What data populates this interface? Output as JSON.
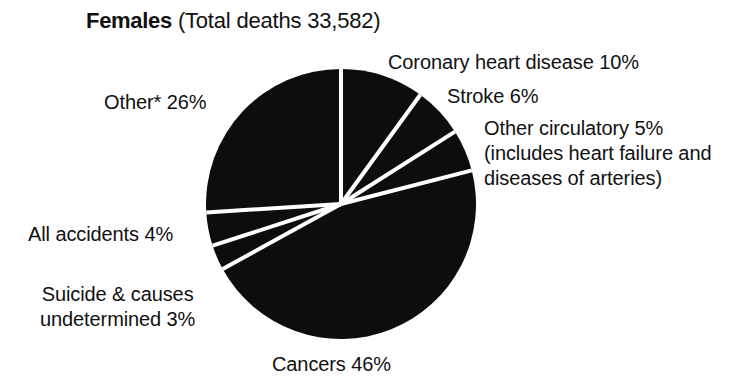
{
  "title": {
    "emphasis": "Females",
    "rest": " (Total deaths 33,582)",
    "full": "Females (Total deaths 33,582)"
  },
  "labels": {
    "coronary": "Coronary heart disease 10%",
    "stroke": "Stroke 6%",
    "other_circulatory_l1": "Other circulatory 5%",
    "other_circulatory_l2": "(includes heart failure and",
    "other_circulatory_l3": "diseases of arteries)",
    "other": "Other* 26%",
    "accidents": "All accidents 4%",
    "suicide_l1": "Suicide & causes",
    "suicide_l2": "undetermined 3%",
    "cancers": "Cancers 46%"
  },
  "colors": {
    "slice_fill": "#0d0d0d",
    "separator": "#ffffff",
    "text": "#111111",
    "background": "#ffffff"
  },
  "chart_data": {
    "type": "pie",
    "title": "Females (Total deaths 33,582)",
    "total_deaths": 33582,
    "total_deaths_label": "33,582",
    "units": "percent of total deaths",
    "start_angle_deg": 0,
    "direction": "clockwise",
    "center": {
      "x": 341,
      "y": 204
    },
    "radius": 135,
    "legend": "none (direct callout labels)",
    "grid": false,
    "categories": [
      "Coronary heart disease",
      "Stroke",
      "Other circulatory",
      "Cancers",
      "Suicide & causes undetermined",
      "All accidents",
      "Other*"
    ],
    "values": [
      10,
      6,
      5,
      46,
      3,
      4,
      26
    ],
    "slices": [
      {
        "label": "Coronary heart disease",
        "value": 10,
        "value_label": "10%",
        "start_deg": 0.0,
        "end_deg": 36.0
      },
      {
        "label": "Stroke",
        "value": 6,
        "value_label": "6%",
        "start_deg": 36.0,
        "end_deg": 57.6
      },
      {
        "label": "Other circulatory",
        "value": 5,
        "value_label": "5%",
        "start_deg": 57.6,
        "end_deg": 75.6,
        "note": "includes heart failure and diseases of arteries"
      },
      {
        "label": "Cancers",
        "value": 46,
        "value_label": "46%",
        "start_deg": 75.6,
        "end_deg": 241.2
      },
      {
        "label": "Suicide & causes undetermined",
        "value": 3,
        "value_label": "3%",
        "start_deg": 241.2,
        "end_deg": 252.0
      },
      {
        "label": "All accidents",
        "value": 4,
        "value_label": "4%",
        "start_deg": 252.0,
        "end_deg": 266.4
      },
      {
        "label": "Other*",
        "value": 26,
        "value_label": "26%",
        "start_deg": 266.4,
        "end_deg": 360.0
      }
    ]
  }
}
